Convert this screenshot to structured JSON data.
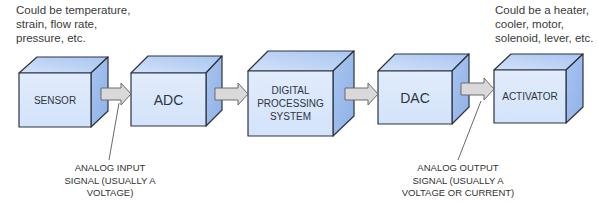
{
  "notes": {
    "input_note": "Could be temperature,\nstrain, flow rate,\npressure, etc.",
    "output_note": "Could be a heater,\ncooler, motor,\nsolenoid, lever, etc."
  },
  "blocks": [
    {
      "id": "sensor",
      "label": "SENSOR"
    },
    {
      "id": "adc",
      "label": "ADC"
    },
    {
      "id": "dsp",
      "label": "DIGITAL\nPROCESSING\nSYSTEM"
    },
    {
      "id": "dac",
      "label": "DAC"
    },
    {
      "id": "activator",
      "label": "ACTIVATOR"
    }
  ],
  "annotations": {
    "analog_input": "ANALOG INPUT\nSIGNAL (USUALLY A\nVOLTAGE)",
    "analog_output": "ANALOG OUTPUT\nSIGNAL (USUALLY A\nVOLTAGE OR CURRENT)"
  },
  "colors": {
    "front": "#dbe8fb",
    "top": "#b9d0f4",
    "side": "#9fbdee",
    "outline": "#2b3440",
    "arrow_fill": "#d9d9d9",
    "arrow_stroke": "#6b6b6b"
  }
}
